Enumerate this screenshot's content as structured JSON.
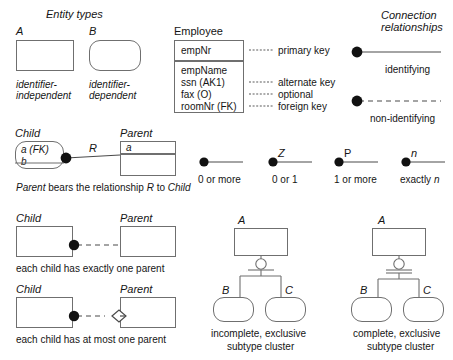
{
  "diagram": {
    "title_entity_types": "Entity types",
    "title_connection": "Connection",
    "title_relationships": "relationships"
  },
  "entity_types": {
    "a_label": "A",
    "a_caption_line1": "identifier-",
    "a_caption_line2": "independent",
    "b_label": "B",
    "b_caption_line1": "identifier-",
    "b_caption_line2": "dependent"
  },
  "employee": {
    "title": "Employee",
    "key_attribute": "empNr",
    "attributes": [
      "empName",
      "ssn (AK1)",
      "fax (O)",
      "roomNr (FK)"
    ],
    "annotations": [
      "primary key",
      "alternate key",
      "optional",
      "foreign key"
    ]
  },
  "connection_relationships": {
    "identifying_label": "identifying",
    "non_identifying_label": "non-identifying"
  },
  "child_parent": {
    "child_label": "Child",
    "parent_label": "Parent",
    "child_attr1": "a (FK)",
    "child_attr2": "b",
    "parent_attr": "a",
    "relationship_label": "R",
    "caption_part1": "Parent",
    "caption_part2": " bears the relationship ",
    "caption_part3": "R",
    "caption_part4": " to ",
    "caption_part5": "Child"
  },
  "cardinality": [
    {
      "symbol": "",
      "label": "0 or more"
    },
    {
      "symbol": "Z",
      "label": "0 or 1"
    },
    {
      "symbol": "P",
      "label": "1 or more"
    },
    {
      "symbol": "n",
      "label": "exactly n",
      "label_plain": "exactly ",
      "label_italic": "n"
    }
  ],
  "examples": [
    {
      "child_label": "Child",
      "parent_label": "Parent",
      "caption": "each child has exactly one parent"
    },
    {
      "child_label": "Child",
      "parent_label": "Parent",
      "caption": "each child has at most one parent"
    }
  ],
  "subtype_clusters": [
    {
      "super_label": "A",
      "sub_label_1": "B",
      "sub_label_2": "C",
      "caption_line1": "incomplete, exclusive",
      "caption_line2": "subtype cluster"
    },
    {
      "super_label": "A",
      "sub_label_1": "B",
      "sub_label_2": "C",
      "caption_line1": "complete, exclusive",
      "caption_line2": "subtype cluster"
    }
  ],
  "colors": {
    "stroke": "#6f6f6f",
    "link": "#4a4a4a",
    "dot": "#111111",
    "text": "#151515",
    "background": "#ffffff"
  }
}
